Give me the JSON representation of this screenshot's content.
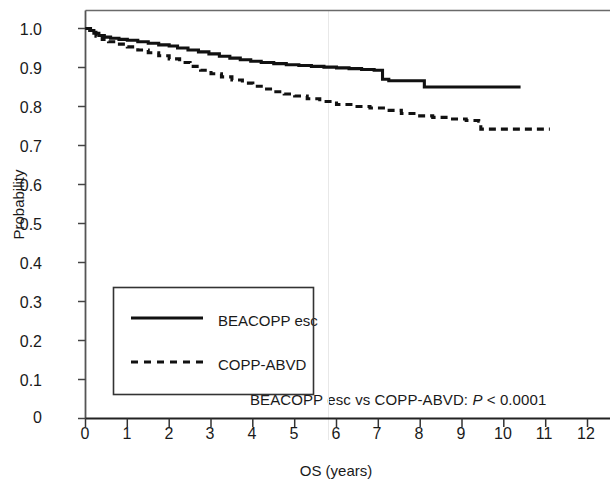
{
  "chart_data": {
    "type": "line",
    "title": "",
    "xlabel": "OS (years)",
    "ylabel": "Probability",
    "xlim": [
      0,
      12
    ],
    "ylim": [
      0,
      1.05
    ],
    "grid": false,
    "legend_position": "lower-left-inset",
    "x_ticks": [
      "0",
      "1",
      "2",
      "3",
      "4",
      "5",
      "6",
      "7",
      "8",
      "9",
      "10",
      "11",
      "12"
    ],
    "y_ticks": [
      "0",
      "0.1",
      "0.2",
      "0.3",
      "0.4",
      "0.5",
      "0.6",
      "0.7",
      "0.8",
      "0.9",
      "1.0"
    ],
    "annotation": "BEACOPP esc vs COPP-ABVD: P < 0.0001",
    "annotation_p_symbol": "P",
    "annotation_prefix": "BEACOPP esc vs COPP-ABVD: ",
    "annotation_suffix": " < 0.0001",
    "series": [
      {
        "name": "BEACOPP esc",
        "style": "solid",
        "color": "#111111",
        "points": [
          [
            0.0,
            1.0
          ],
          [
            0.1,
            0.995
          ],
          [
            0.2,
            0.988
          ],
          [
            0.32,
            0.982
          ],
          [
            0.45,
            0.978
          ],
          [
            0.6,
            0.975
          ],
          [
            0.8,
            0.972
          ],
          [
            1.0,
            0.97
          ],
          [
            1.25,
            0.966
          ],
          [
            1.5,
            0.962
          ],
          [
            1.75,
            0.958
          ],
          [
            2.0,
            0.955
          ],
          [
            2.2,
            0.95
          ],
          [
            2.45,
            0.945
          ],
          [
            2.7,
            0.94
          ],
          [
            2.95,
            0.935
          ],
          [
            3.2,
            0.929
          ],
          [
            3.45,
            0.924
          ],
          [
            3.7,
            0.92
          ],
          [
            3.95,
            0.916
          ],
          [
            4.2,
            0.913
          ],
          [
            4.5,
            0.91
          ],
          [
            4.8,
            0.907
          ],
          [
            5.1,
            0.905
          ],
          [
            5.4,
            0.903
          ],
          [
            5.7,
            0.901
          ],
          [
            6.0,
            0.899
          ],
          [
            6.3,
            0.897
          ],
          [
            6.6,
            0.895
          ],
          [
            6.9,
            0.893
          ],
          [
            7.0,
            0.893
          ],
          [
            7.1,
            0.87
          ],
          [
            7.25,
            0.866
          ],
          [
            7.5,
            0.866
          ],
          [
            8.0,
            0.866
          ],
          [
            8.1,
            0.85
          ],
          [
            9.0,
            0.85
          ],
          [
            10.0,
            0.85
          ],
          [
            10.4,
            0.85
          ]
        ]
      },
      {
        "name": "COPP-ABVD",
        "style": "dashed",
        "color": "#111111",
        "points": [
          [
            0.0,
            1.0
          ],
          [
            0.12,
            0.99
          ],
          [
            0.25,
            0.98
          ],
          [
            0.4,
            0.972
          ],
          [
            0.55,
            0.966
          ],
          [
            0.75,
            0.96
          ],
          [
            1.0,
            0.953
          ],
          [
            1.25,
            0.945
          ],
          [
            1.5,
            0.938
          ],
          [
            1.75,
            0.93
          ],
          [
            2.0,
            0.922
          ],
          [
            2.25,
            0.913
          ],
          [
            2.5,
            0.903
          ],
          [
            2.75,
            0.893
          ],
          [
            3.0,
            0.884
          ],
          [
            3.25,
            0.876
          ],
          [
            3.5,
            0.868
          ],
          [
            3.75,
            0.86
          ],
          [
            4.0,
            0.852
          ],
          [
            4.25,
            0.845
          ],
          [
            4.5,
            0.838
          ],
          [
            4.75,
            0.832
          ],
          [
            5.0,
            0.827
          ],
          [
            5.3,
            0.82
          ],
          [
            5.6,
            0.813
          ],
          [
            6.0,
            0.805
          ],
          [
            6.4,
            0.8
          ],
          [
            6.8,
            0.796
          ],
          [
            7.2,
            0.79
          ],
          [
            7.55,
            0.782
          ],
          [
            7.9,
            0.776
          ],
          [
            8.3,
            0.772
          ],
          [
            8.7,
            0.768
          ],
          [
            9.1,
            0.764
          ],
          [
            9.4,
            0.762
          ],
          [
            9.45,
            0.742
          ],
          [
            10.0,
            0.742
          ],
          [
            10.6,
            0.742
          ],
          [
            11.1,
            0.742
          ]
        ]
      }
    ]
  },
  "axes": {
    "y_label": "Probability",
    "x_label": "OS (years)"
  },
  "legend": {
    "items": [
      {
        "label": "BEACOPP esc",
        "style": "solid"
      },
      {
        "label": "COPP-ABVD",
        "style": "dashed"
      }
    ]
  },
  "colors": {
    "line": "#111111",
    "frame": "#555555",
    "text": "#1a1a1a",
    "background": "#ffffff"
  }
}
